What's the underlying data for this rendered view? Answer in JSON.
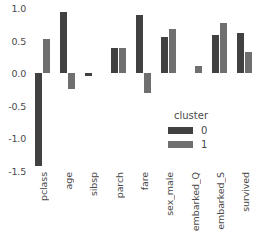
{
  "chart_data": {
    "type": "bar",
    "title": "",
    "subtitle": "",
    "xlabel": "",
    "ylabel": "",
    "grid": false,
    "ylim": [
      -1.5,
      1.0
    ],
    "yticks": [
      1.0,
      0.5,
      0.0,
      -0.5,
      -1.0,
      -1.5
    ],
    "ytick_labels": [
      "1.0",
      "0.5",
      "0.0",
      "-0.5",
      "-1.0",
      "-1.5"
    ],
    "categories": [
      "pclass",
      "age",
      "sibsp",
      "parch",
      "fare",
      "sex_male",
      "embarked_Q",
      "embarked_S",
      "survived"
    ],
    "legend": {
      "title": "cluster",
      "position": "inside-right",
      "entries": [
        {
          "label": "0",
          "color": "#414141"
        },
        {
          "label": "1",
          "color": "#6f6f6f"
        }
      ]
    },
    "series": [
      {
        "name": "0",
        "color": "#414141",
        "values": [
          -1.42,
          0.94,
          -0.05,
          0.38,
          0.9,
          0.55,
          0.0,
          0.59,
          0.61
        ]
      },
      {
        "name": "1",
        "color": "#6f6f6f",
        "values": [
          0.52,
          -0.24,
          0.0,
          0.39,
          -0.3,
          0.68,
          0.11,
          0.77,
          0.32
        ]
      }
    ]
  }
}
